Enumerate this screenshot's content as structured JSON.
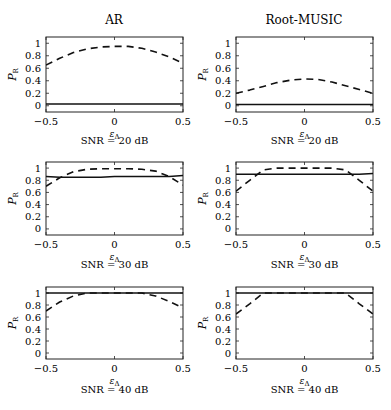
{
  "figure": {
    "column_titles": [
      "AR",
      "Root-MUSIC"
    ],
    "row_captions": [
      "SNR = 20 dB",
      "SNR = 30 dB",
      "SNR = 40 dB"
    ],
    "xlabel": "ε_Δ",
    "ylabel": "P_R"
  },
  "chart_data": [
    {
      "type": "line",
      "title": "AR",
      "caption": "SNR = 20 dB",
      "xlabel": "ε_Δ",
      "ylabel": "P_R",
      "xlim": [
        -0.5,
        0.5
      ],
      "ylim": [
        -0.1,
        1.1
      ],
      "xticks": [
        -0.5,
        0,
        0.5
      ],
      "yticks": [
        0,
        0.2,
        0.4,
        0.6,
        0.8,
        1
      ],
      "grid": false,
      "x": [
        -0.5,
        -0.4,
        -0.3,
        -0.2,
        -0.1,
        0,
        0.1,
        0.2,
        0.3,
        0.4,
        0.5
      ],
      "series": [
        {
          "name": "dashed",
          "style": "dashed",
          "values": [
            0.65,
            0.76,
            0.85,
            0.91,
            0.94,
            0.95,
            0.95,
            0.92,
            0.86,
            0.78,
            0.68
          ]
        },
        {
          "name": "solid",
          "style": "solid",
          "values": [
            0.03,
            0.03,
            0.03,
            0.03,
            0.03,
            0.03,
            0.03,
            0.03,
            0.03,
            0.03,
            0.03
          ]
        }
      ]
    },
    {
      "type": "line",
      "title": "Root-MUSIC",
      "caption": "SNR = 20 dB",
      "xlabel": "ε_Δ",
      "ylabel": "P_R",
      "xlim": [
        -0.5,
        0.5
      ],
      "ylim": [
        -0.1,
        1.1
      ],
      "xticks": [
        -0.5,
        0,
        0.5
      ],
      "yticks": [
        0,
        0.2,
        0.4,
        0.6,
        0.8,
        1
      ],
      "grid": false,
      "x": [
        -0.5,
        -0.4,
        -0.3,
        -0.2,
        -0.1,
        0,
        0.1,
        0.2,
        0.3,
        0.4,
        0.5
      ],
      "series": [
        {
          "name": "dashed",
          "style": "dashed",
          "values": [
            0.2,
            0.25,
            0.31,
            0.37,
            0.41,
            0.43,
            0.42,
            0.38,
            0.32,
            0.26,
            0.2
          ]
        },
        {
          "name": "solid",
          "style": "solid",
          "values": [
            0.02,
            0.02,
            0.02,
            0.02,
            0.02,
            0.02,
            0.02,
            0.02,
            0.02,
            0.02,
            0.02
          ]
        }
      ]
    },
    {
      "type": "line",
      "title": "",
      "caption": "SNR = 30 dB",
      "xlabel": "ε_Δ",
      "ylabel": "P_R",
      "xlim": [
        -0.5,
        0.5
      ],
      "ylim": [
        -0.1,
        1.1
      ],
      "xticks": [
        -0.5,
        0,
        0.5
      ],
      "yticks": [
        0,
        0.2,
        0.4,
        0.6,
        0.8,
        1
      ],
      "grid": false,
      "x": [
        -0.5,
        -0.4,
        -0.3,
        -0.2,
        -0.1,
        0,
        0.1,
        0.2,
        0.3,
        0.4,
        0.5
      ],
      "series": [
        {
          "name": "dashed",
          "style": "dashed",
          "values": [
            0.7,
            0.84,
            0.94,
            0.98,
            0.99,
            0.99,
            0.99,
            0.98,
            0.95,
            0.86,
            0.72
          ]
        },
        {
          "name": "solid",
          "style": "solid",
          "values": [
            0.86,
            0.85,
            0.85,
            0.85,
            0.85,
            0.86,
            0.86,
            0.86,
            0.86,
            0.86,
            0.88
          ]
        }
      ]
    },
    {
      "type": "line",
      "title": "",
      "caption": "SNR = 30 dB",
      "xlabel": "ε_Δ",
      "ylabel": "P_R",
      "xlim": [
        -0.5,
        0.5
      ],
      "ylim": [
        -0.1,
        1.1
      ],
      "xticks": [
        -0.5,
        0,
        0.5
      ],
      "yticks": [
        0,
        0.2,
        0.4,
        0.6,
        0.8,
        1
      ],
      "grid": false,
      "x": [
        -0.5,
        -0.4,
        -0.3,
        -0.2,
        -0.1,
        0,
        0.1,
        0.2,
        0.3,
        0.4,
        0.5
      ],
      "series": [
        {
          "name": "dashed",
          "style": "dashed",
          "values": [
            0.62,
            0.8,
            0.97,
            1.0,
            1.0,
            1.0,
            1.0,
            1.0,
            0.97,
            0.8,
            0.62
          ]
        },
        {
          "name": "solid",
          "style": "solid",
          "values": [
            0.9,
            0.9,
            0.9,
            0.9,
            0.9,
            0.9,
            0.9,
            0.9,
            0.9,
            0.9,
            0.91
          ]
        }
      ]
    },
    {
      "type": "line",
      "title": "",
      "caption": "SNR = 40 dB",
      "xlabel": "ε_Δ",
      "ylabel": "P_R",
      "xlim": [
        -0.5,
        0.5
      ],
      "ylim": [
        -0.1,
        1.1
      ],
      "xticks": [
        -0.5,
        0,
        0.5
      ],
      "yticks": [
        0,
        0.2,
        0.4,
        0.6,
        0.8,
        1
      ],
      "grid": false,
      "x": [
        -0.5,
        -0.4,
        -0.3,
        -0.2,
        -0.1,
        0,
        0.1,
        0.2,
        0.3,
        0.4,
        0.5
      ],
      "series": [
        {
          "name": "dashed",
          "style": "dashed",
          "values": [
            0.7,
            0.85,
            0.95,
            1.0,
            1.0,
            1.0,
            1.0,
            1.0,
            0.95,
            0.86,
            0.75
          ]
        },
        {
          "name": "solid",
          "style": "solid",
          "values": [
            1.0,
            1.0,
            1.0,
            1.0,
            1.0,
            1.0,
            1.0,
            1.0,
            1.0,
            1.0,
            1.0
          ]
        }
      ]
    },
    {
      "type": "line",
      "title": "",
      "caption": "SNR = 40 dB",
      "xlabel": "ε_Δ",
      "ylabel": "P_R",
      "xlim": [
        -0.5,
        0.5
      ],
      "ylim": [
        -0.1,
        1.1
      ],
      "xticks": [
        -0.5,
        0,
        0.5
      ],
      "yticks": [
        0,
        0.2,
        0.4,
        0.6,
        0.8,
        1
      ],
      "grid": false,
      "x": [
        -0.5,
        -0.4,
        -0.3,
        -0.2,
        -0.1,
        0,
        0.1,
        0.2,
        0.3,
        0.4,
        0.5
      ],
      "series": [
        {
          "name": "dashed",
          "style": "dashed",
          "values": [
            0.65,
            0.82,
            1.0,
            1.0,
            1.0,
            1.0,
            1.0,
            1.0,
            1.0,
            0.82,
            0.65
          ]
        },
        {
          "name": "solid",
          "style": "solid",
          "values": [
            1.0,
            1.0,
            1.0,
            1.0,
            1.0,
            1.0,
            1.0,
            1.0,
            1.0,
            1.0,
            1.0
          ]
        }
      ]
    }
  ]
}
